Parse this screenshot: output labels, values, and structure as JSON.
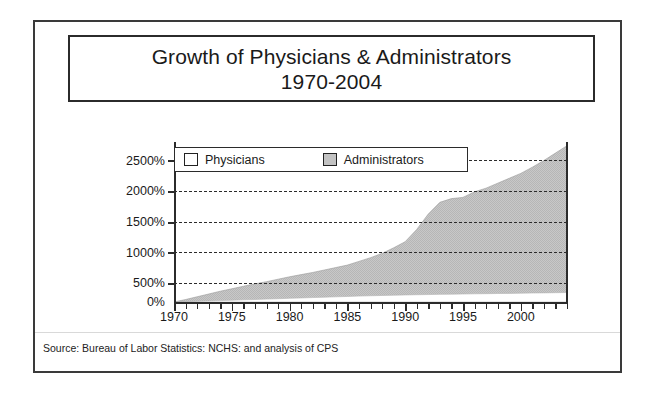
{
  "title": {
    "line1": "Growth of Physicians & Administrators",
    "line2": "1970-2004"
  },
  "subtitle": "GROWTH SINCE 1970",
  "source": "Source: Bureau of Labor Statistics: NCHS: and analysis of CPS",
  "legend": {
    "position": "top-left-inside-plot",
    "items": [
      {
        "label": "Physicians",
        "color": "#ffffff",
        "swatch": "white-square-icon"
      },
      {
        "label": "Administrators",
        "color": "#c2c2c2",
        "swatch": "gray-square-icon"
      }
    ]
  },
  "colors": {
    "administrators_fill": "#c2c2c2",
    "physicians_fill": "#ffffff",
    "axis": "#2b2b2b",
    "grid": "#2b2b2b",
    "frame": "#3a3a3a",
    "background": "#ffffff"
  },
  "chart_data": {
    "type": "area",
    "title": "Growth of Physicians & Administrators 1970-2004",
    "subtitle": "GROWTH SINCE 1970",
    "xlabel": "",
    "ylabel": "GROWTH SINCE 1970",
    "xlim": [
      1970,
      2004
    ],
    "ylim": [
      0,
      2600
    ],
    "yticks": [
      0,
      500,
      1000,
      1500,
      2000,
      2500
    ],
    "ytick_labels": [
      "0%",
      "500%",
      "1000%",
      "1500%",
      "2000%",
      "2500%"
    ],
    "xticks": [
      1970,
      1975,
      1980,
      1985,
      1990,
      1995,
      2000
    ],
    "xtick_labels": [
      "1970",
      "1975",
      "1980",
      "1985",
      "1990",
      "1995",
      "2000"
    ],
    "x_minor_tick_interval": 1,
    "grid": "horizontal-dashed",
    "legend_position": "upper left",
    "x": [
      1970,
      1971,
      1972,
      1973,
      1974,
      1975,
      1976,
      1977,
      1978,
      1979,
      1980,
      1981,
      1982,
      1983,
      1984,
      1985,
      1986,
      1987,
      1988,
      1989,
      1990,
      1991,
      1992,
      1993,
      1994,
      1995,
      1996,
      1997,
      1998,
      1999,
      2000,
      2001,
      2002,
      2003,
      2004
    ],
    "series": [
      {
        "name": "Physicians",
        "values": [
          0,
          5,
          11,
          17,
          23,
          29,
          35,
          41,
          47,
          53,
          60,
          66,
          72,
          78,
          84,
          90,
          96,
          101,
          106,
          110,
          114,
          118,
          121,
          124,
          127,
          130,
          133,
          135,
          138,
          140,
          143,
          146,
          148,
          151,
          154
        ]
      },
      {
        "name": "Administrators",
        "values": [
          0,
          40,
          85,
          130,
          175,
          215,
          255,
          295,
          330,
          370,
          410,
          445,
          480,
          520,
          560,
          600,
          660,
          720,
          790,
          880,
          980,
          1180,
          1430,
          1620,
          1680,
          1700,
          1790,
          1850,
          1930,
          2010,
          2090,
          2190,
          2300,
          2420,
          2540
        ]
      }
    ]
  }
}
